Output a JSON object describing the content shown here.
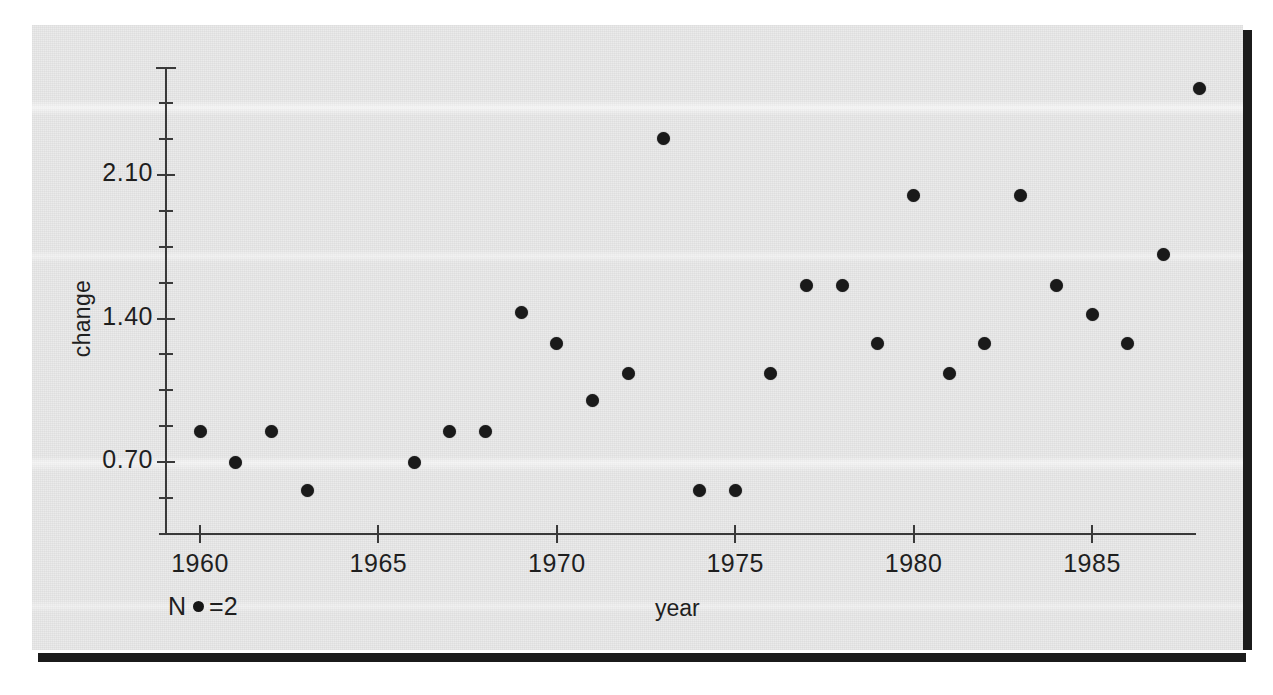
{
  "chart_data": {
    "type": "scatter",
    "title": "",
    "xlabel": "year",
    "ylabel": "change",
    "xlim": [
      1959.0,
      1988.6
    ],
    "ylim": [
      0.18,
      2.52
    ],
    "grid": false,
    "legend": "N •=2",
    "legend_note_prefix": "N",
    "legend_note_suffix": "=2",
    "x_ticks": [
      1960,
      1965,
      1970,
      1975,
      1980,
      1985
    ],
    "x_tick_labels": [
      "1960",
      "1965",
      "1970",
      "1975",
      "1980",
      "1985"
    ],
    "y_ticks": [
      0.7,
      1.4,
      2.1
    ],
    "y_tick_labels": [
      "0.70",
      "1.40",
      "2.10"
    ],
    "y_minor_step": 0.175,
    "marker": "filled-circle",
    "marker_color": "#1a1a1a",
    "x": [
      1960,
      1961,
      1962,
      1963,
      1966,
      1967,
      1968,
      1969,
      1970,
      1971,
      1972,
      1973,
      1974,
      1975,
      1976,
      1977,
      1978,
      1979,
      1980,
      1981,
      1982,
      1983,
      1984,
      1985,
      1986,
      1987
    ],
    "y": [
      0.85,
      0.7,
      0.85,
      0.56,
      0.7,
      0.85,
      0.85,
      1.43,
      1.28,
      1.0,
      1.13,
      2.28,
      0.56,
      0.56,
      1.13,
      1.56,
      1.56,
      1.28,
      2.0,
      1.13,
      1.28,
      2.0,
      1.56,
      1.42,
      1.28,
      1.71
    ],
    "points": [
      {
        "year": 1960,
        "change": 0.85
      },
      {
        "year": 1961,
        "change": 0.7
      },
      {
        "year": 1962,
        "change": 0.85
      },
      {
        "year": 1963,
        "change": 0.56
      },
      {
        "year": 1966,
        "change": 0.7
      },
      {
        "year": 1967,
        "change": 0.85
      },
      {
        "year": 1968,
        "change": 0.85
      },
      {
        "year": 1969,
        "change": 1.43
      },
      {
        "year": 1970,
        "change": 1.28
      },
      {
        "year": 1971,
        "change": 1.0
      },
      {
        "year": 1972,
        "change": 1.13
      },
      {
        "year": 1973,
        "change": 2.28
      },
      {
        "year": 1974,
        "change": 0.56
      },
      {
        "year": 1975,
        "change": 0.56
      },
      {
        "year": 1976,
        "change": 1.13
      },
      {
        "year": 1977,
        "change": 1.56
      },
      {
        "year": 1978,
        "change": 1.56
      },
      {
        "year": 1979,
        "change": 1.28
      },
      {
        "year": 1980,
        "change": 2.0
      },
      {
        "year": 1981,
        "change": 1.13
      },
      {
        "year": 1982,
        "change": 1.28
      },
      {
        "year": 1983,
        "change": 2.0
      },
      {
        "year": 1984,
        "change": 1.56
      },
      {
        "year": 1985,
        "change": 1.42
      },
      {
        "year": 1986,
        "change": 1.28
      },
      {
        "year": 1987,
        "change": 1.71
      },
      {
        "year": 1988,
        "change": 2.52
      }
    ]
  },
  "colors": {
    "background": "#e9e9e9",
    "marker": "#1a1a1a",
    "axis": "#3a3a3a",
    "text": "#1f1f1f",
    "scan_edge": "#1b1b1b"
  }
}
